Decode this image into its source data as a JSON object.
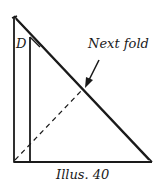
{
  "diagram": {
    "labels": {
      "point": "D",
      "annotation": "Next fold",
      "caption": "Illus. 40"
    },
    "colors": {
      "stroke": "#1a1a1a",
      "background": "#ffffff"
    },
    "shapes": [
      {
        "type": "outer-triangle",
        "desc": "right triangle, right angle bottom-left"
      },
      {
        "type": "inner-vertical-line",
        "desc": "folded edge near left"
      },
      {
        "type": "dashed-fold-line",
        "desc": "from bottom-left to hypotenuse"
      },
      {
        "type": "arrow",
        "desc": "points from 'Next fold' label to dashed line"
      }
    ]
  }
}
